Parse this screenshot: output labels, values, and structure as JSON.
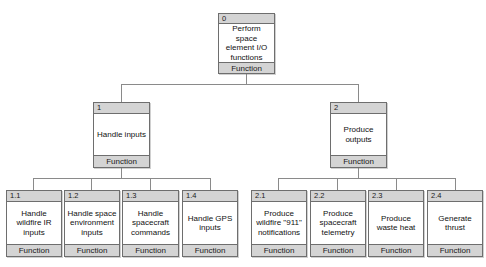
{
  "diagram": {
    "type": "function-hierarchy-tree",
    "type_label": "Function",
    "nodes": {
      "root": {
        "id": "0",
        "name": "Perform space element I/O functions",
        "type": "Function"
      },
      "l1_handle_inputs": {
        "id": "1",
        "name": "Handle inputs",
        "type": "Function"
      },
      "l1_produce_outputs": {
        "id": "2",
        "name": "Produce outputs",
        "type": "Function"
      },
      "l2_1_1": {
        "id": "1.1",
        "name": "Handle wildfire IR inputs",
        "type": "Function"
      },
      "l2_1_2": {
        "id": "1.2",
        "name": "Handle space environment inputs",
        "type": "Function"
      },
      "l2_1_3": {
        "id": "1.3",
        "name": "Handle spacecraft commands",
        "type": "Function"
      },
      "l2_1_4": {
        "id": "1.4",
        "name": "Handle GPS inputs",
        "type": "Function"
      },
      "l2_2_1": {
        "id": "2.1",
        "name": "Produce wildfire \"911\" notifications",
        "type": "Function"
      },
      "l2_2_2": {
        "id": "2.2",
        "name": "Produce spacecraft telemetry",
        "type": "Function"
      },
      "l2_2_3": {
        "id": "2.3",
        "name": "Produce waste heat",
        "type": "Function"
      },
      "l2_2_4": {
        "id": "2.4",
        "name": "Generate thrust",
        "type": "Function"
      }
    },
    "colors": {
      "background": "#ffffff",
      "box_fill": "#ffffff",
      "header_fill": "#d4d4d4",
      "footer_fill": "#d4d4d4",
      "border": "#6e6e6e",
      "connector": "#8a8a8a",
      "text": "#111111"
    }
  }
}
